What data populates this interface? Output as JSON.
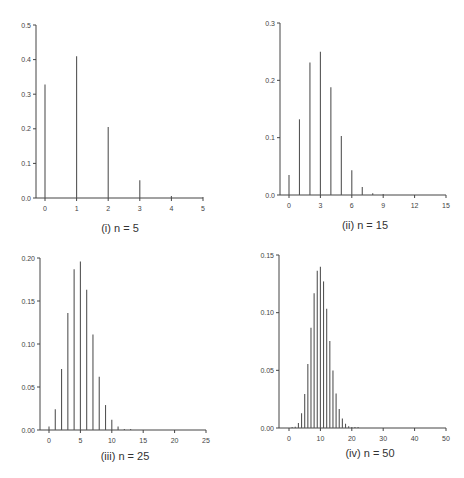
{
  "chart_data": [
    {
      "type": "bar",
      "title": "(i) n = 5",
      "caption": "(i) n = 5",
      "xlabel": "",
      "ylabel": "",
      "x": [
        0,
        1,
        2,
        3,
        4,
        5
      ],
      "values": [
        0.328,
        0.41,
        0.205,
        0.051,
        0.006,
        0.0003
      ],
      "xlim": [
        0,
        5
      ],
      "ylim": [
        0,
        0.5
      ],
      "xticks": [
        "0",
        "1",
        "2",
        "3",
        "4",
        "5"
      ],
      "yticks": [
        "0.0",
        "0.1",
        "0.2",
        "0.3",
        "0.4",
        "0.5"
      ],
      "grid": false,
      "frame": {
        "axisX": 36,
        "x0": 45,
        "x1": 203,
        "y0": 198,
        "y1": 25,
        "captionX": 120,
        "captionY": 232
      }
    },
    {
      "type": "bar",
      "title": "(ii) n = 15",
      "caption": "(ii) n = 15",
      "xlabel": "",
      "ylabel": "",
      "x": [
        0,
        1,
        2,
        3,
        4,
        5,
        6,
        7,
        8,
        9,
        10,
        11,
        12,
        13,
        14,
        15
      ],
      "values": [
        0.035,
        0.132,
        0.231,
        0.25,
        0.188,
        0.103,
        0.043,
        0.014,
        0.003,
        0.001,
        0,
        0,
        0,
        0,
        0,
        0
      ],
      "xlim": [
        0,
        15
      ],
      "ylim": [
        0,
        0.3
      ],
      "xticks": [
        "0",
        "3",
        "6",
        "9",
        "12",
        "15"
      ],
      "yticks": [
        "0.0",
        "0.1",
        "0.2",
        "0.3"
      ],
      "grid": false,
      "frame": {
        "axisX": 280,
        "x0": 289,
        "x1": 446,
        "y0": 195,
        "y1": 23,
        "captionX": 365,
        "captionY": 229
      }
    },
    {
      "type": "bar",
      "title": "(iii) n = 25",
      "caption": "(iii) n = 25",
      "xlabel": "",
      "ylabel": "",
      "x": [
        0,
        1,
        2,
        3,
        4,
        5,
        6,
        7,
        8,
        9,
        10,
        11,
        12,
        13
      ],
      "values": [
        0.004,
        0.024,
        0.071,
        0.136,
        0.187,
        0.196,
        0.163,
        0.111,
        0.062,
        0.029,
        0.012,
        0.004,
        0.001,
        0.0002
      ],
      "xlim": [
        0,
        25
      ],
      "ylim": [
        0,
        0.2
      ],
      "xticks": [
        "0",
        "5",
        "10",
        "15",
        "20",
        "25"
      ],
      "yticks": [
        "0.00",
        "0.05",
        "0.10",
        "0.15",
        "0.20"
      ],
      "grid": false,
      "frame": {
        "axisX": 40,
        "x0": 49,
        "x1": 206,
        "y0": 430,
        "y1": 258,
        "captionX": 125,
        "captionY": 460
      }
    },
    {
      "type": "bar",
      "title": "(iv) n = 50",
      "caption": "(iv) n = 50",
      "xlabel": "",
      "ylabel": "",
      "x": [
        0,
        1,
        2,
        3,
        4,
        5,
        6,
        7,
        8,
        9,
        10,
        11,
        12,
        13,
        14,
        15,
        16,
        17,
        18,
        19,
        20,
        21,
        22
      ],
      "values": [
        0.0,
        0.0002,
        0.0011,
        0.0044,
        0.0128,
        0.0295,
        0.0554,
        0.087,
        0.1169,
        0.1364,
        0.1398,
        0.1271,
        0.1033,
        0.0755,
        0.0499,
        0.0299,
        0.0164,
        0.0082,
        0.0037,
        0.0016,
        0.0006,
        0.0002,
        0.0001
      ],
      "xlim": [
        0,
        50
      ],
      "ylim": [
        0,
        0.15
      ],
      "xticks": [
        "0",
        "10",
        "20",
        "30",
        "40",
        "50"
      ],
      "yticks": [
        "0.00",
        "0.05",
        "0.10",
        "0.15"
      ],
      "grid": false,
      "frame": {
        "axisX": 279,
        "x0": 289,
        "x1": 446,
        "y0": 428,
        "y1": 255,
        "captionX": 370,
        "captionY": 457
      }
    }
  ]
}
